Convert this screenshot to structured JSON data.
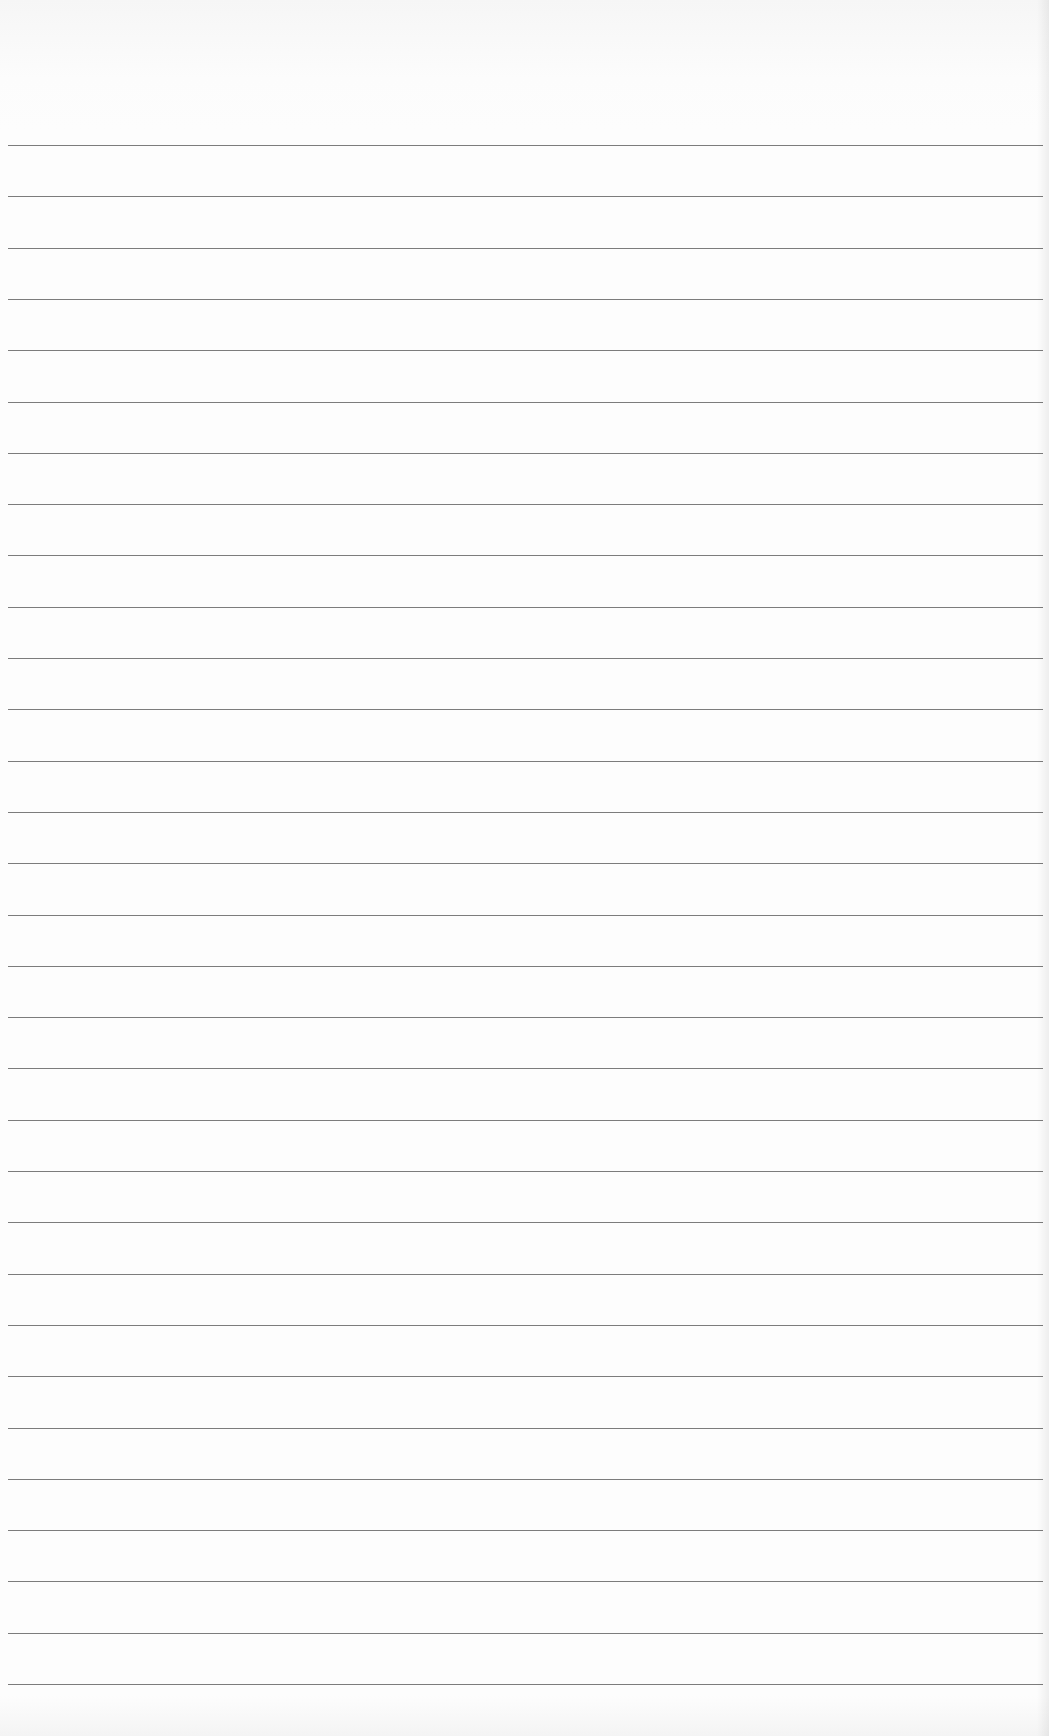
{
  "page": {
    "type": "blank ruled notebook paper",
    "paper_color": "#fdfdfd",
    "rule_color": "#6e6e6e",
    "rule_count": 34,
    "first_rule_y": 145,
    "rule_spacing_px": 51.3,
    "text_content": ""
  }
}
